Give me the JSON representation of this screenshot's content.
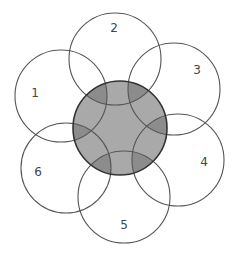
{
  "diagram": {
    "type": "venn-flower",
    "center": {
      "cx": 120,
      "cy": 128,
      "r": 47,
      "fill": "#a9a9a9",
      "overlap_fill": "#8c8c8c",
      "stroke": "#333333"
    },
    "petals": [
      {
        "label": "1",
        "cx": 61,
        "cy": 96,
        "r": 46,
        "lx": 35,
        "ly": 93
      },
      {
        "label": "2",
        "cx": 115,
        "cy": 59,
        "r": 46,
        "lx": 114,
        "ly": 28
      },
      {
        "label": "3",
        "cx": 174,
        "cy": 89,
        "r": 46,
        "lx": 197,
        "ly": 70
      },
      {
        "label": "4",
        "cx": 178,
        "cy": 160,
        "r": 46,
        "lx": 204,
        "ly": 162
      },
      {
        "label": "5",
        "cx": 124,
        "cy": 197,
        "r": 46,
        "lx": 124,
        "ly": 225
      },
      {
        "label": "6",
        "cx": 66,
        "cy": 168,
        "r": 45,
        "lx": 38,
        "ly": 172
      }
    ],
    "petal_stroke": "#555555"
  }
}
